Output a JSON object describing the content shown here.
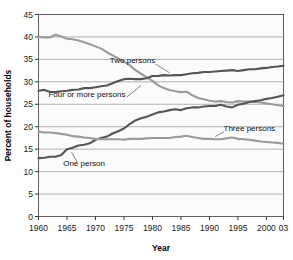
{
  "chart_data": {
    "type": "line",
    "title": "",
    "xlabel": "Year",
    "ylabel": "Percent of households",
    "xlim": [
      1960,
      2003
    ],
    "ylim": [
      0,
      45
    ],
    "grid": true,
    "legend_position": "inline-annotations",
    "xticks": [
      "1960",
      "1965",
      "1970",
      "1975",
      "1980",
      "1985",
      "1990",
      "1995",
      "2000",
      "03"
    ],
    "xtick_values": [
      1960,
      1965,
      1970,
      1975,
      1980,
      1985,
      1990,
      1995,
      2000,
      2003
    ],
    "yticks": [
      "0",
      "5",
      "10",
      "15",
      "20",
      "25",
      "30",
      "35",
      "40",
      "45"
    ],
    "ytick_values": [
      0,
      5,
      10,
      15,
      20,
      25,
      30,
      35,
      40,
      45
    ],
    "x": [
      1960,
      1961,
      1962,
      1963,
      1964,
      1965,
      1966,
      1967,
      1968,
      1969,
      1970,
      1971,
      1972,
      1973,
      1974,
      1975,
      1976,
      1977,
      1978,
      1979,
      1980,
      1981,
      1982,
      1983,
      1984,
      1985,
      1986,
      1987,
      1988,
      1989,
      1990,
      1991,
      1992,
      1993,
      1994,
      1995,
      1996,
      1997,
      1998,
      1999,
      2000,
      2001,
      2002,
      2003
    ],
    "series": [
      {
        "name": "Four or more persons",
        "color": "#9a9a9a",
        "label": "Four or more persons",
        "label_x": 1968.5,
        "label_y": 26.6,
        "leader_from": [
          1975.5,
          26.6
        ],
        "leader_to": [
          1978.0,
          29.2
        ],
        "values": [
          40.0,
          39.9,
          39.9,
          40.5,
          40.1,
          39.6,
          39.5,
          39.2,
          38.8,
          38.4,
          37.9,
          37.4,
          36.6,
          35.9,
          35.2,
          34.5,
          33.7,
          32.6,
          31.8,
          31.0,
          30.2,
          29.2,
          28.6,
          28.2,
          27.9,
          27.7,
          27.8,
          27.0,
          26.4,
          26.1,
          25.8,
          25.6,
          25.7,
          25.5,
          25.4,
          25.7,
          25.6,
          25.6,
          25.5,
          25.4,
          25.2,
          25.0,
          24.8,
          24.6
        ]
      },
      {
        "name": "Two persons",
        "color": "#555555",
        "label": "Two persons",
        "label_x": 1976.5,
        "label_y": 34.2,
        "leader_from": [
          1980.5,
          34.0
        ],
        "leader_to": [
          1983.0,
          32.0
        ],
        "values": [
          28.0,
          28.2,
          27.8,
          27.7,
          27.9,
          28.0,
          28.2,
          28.3,
          28.6,
          28.6,
          28.8,
          29.0,
          29.2,
          29.7,
          30.2,
          30.6,
          30.7,
          30.6,
          30.6,
          30.8,
          31.3,
          31.3,
          31.5,
          31.4,
          31.5,
          31.5,
          31.7,
          31.9,
          32.0,
          32.2,
          32.2,
          32.3,
          32.4,
          32.5,
          32.6,
          32.4,
          32.6,
          32.8,
          32.8,
          33.0,
          33.1,
          33.3,
          33.4,
          33.6
        ]
      },
      {
        "name": "One person",
        "color": "#555555",
        "label": "One person",
        "label_x": 1968.0,
        "label_y": 11.2,
        "leader_from": [
          1966.8,
          12.1
        ],
        "leader_to": [
          1965.8,
          14.3
        ],
        "values": [
          13.0,
          13.1,
          13.3,
          13.3,
          13.7,
          15.0,
          15.3,
          15.8,
          16.0,
          16.3,
          17.1,
          17.5,
          17.8,
          18.5,
          19.0,
          19.6,
          20.6,
          21.4,
          21.9,
          22.2,
          22.7,
          23.2,
          23.4,
          23.7,
          23.9,
          23.7,
          24.1,
          24.3,
          24.3,
          24.5,
          24.6,
          24.6,
          24.9,
          24.5,
          24.3,
          24.9,
          25.1,
          25.5,
          25.7,
          25.9,
          26.2,
          26.4,
          26.7,
          27.0
        ]
      },
      {
        "name": "Three persons",
        "color": "#9a9a9a",
        "label": "Three persons",
        "label_x": 1997.0,
        "label_y": 19.1,
        "leader_from": [
          1992.6,
          18.9
        ],
        "leader_to": [
          1991.0,
          17.8
        ],
        "values": [
          18.9,
          18.7,
          18.7,
          18.6,
          18.4,
          18.2,
          17.9,
          17.8,
          17.6,
          17.5,
          17.3,
          17.2,
          17.2,
          17.2,
          17.2,
          17.1,
          17.3,
          17.3,
          17.3,
          17.4,
          17.5,
          17.5,
          17.5,
          17.5,
          17.7,
          17.8,
          18.0,
          17.7,
          17.5,
          17.3,
          17.3,
          17.2,
          17.2,
          17.4,
          17.6,
          17.3,
          17.2,
          17.1,
          16.9,
          16.7,
          16.6,
          16.5,
          16.4,
          16.2
        ]
      }
    ]
  }
}
